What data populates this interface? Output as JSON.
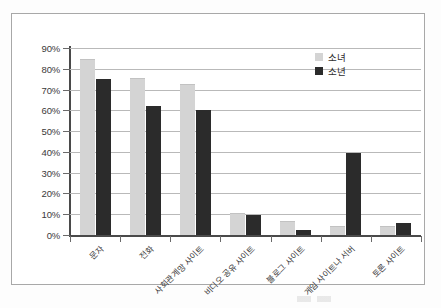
{
  "chart_data": {
    "type": "bar",
    "title": "",
    "xlabel": "",
    "ylabel": "",
    "ylim": [
      0,
      90
    ],
    "grid": true,
    "legend_position": "top-right",
    "categories": [
      "문자",
      "전화",
      "사회관계망 사이트",
      "비디오 공유 사이트",
      "블로그 사이트",
      "게임 사이트나 서버",
      "토론 사이트"
    ],
    "series": [
      {
        "name": "소녀",
        "color": "#d4d4d4",
        "values": [
          84,
          75,
          72,
          10,
          6.5,
          4,
          4
        ]
      },
      {
        "name": "소년",
        "color": "#2b2b2b",
        "values": [
          75,
          62,
          60,
          9.5,
          2.5,
          39.5,
          6
        ]
      }
    ],
    "y_ticks": [
      "0%",
      "10%",
      "20%",
      "30%",
      "40%",
      "50%",
      "60%",
      "70%",
      "80%",
      "90%"
    ],
    "y_tick_values": [
      0,
      10,
      20,
      30,
      40,
      50,
      60,
      70,
      80,
      90
    ]
  }
}
